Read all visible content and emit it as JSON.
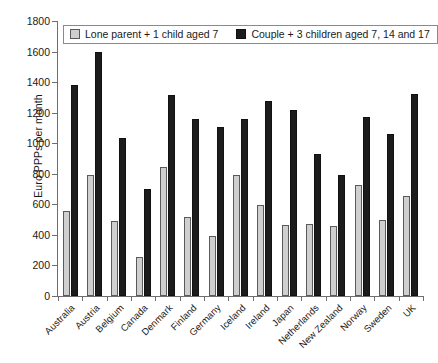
{
  "chart_data": {
    "type": "bar",
    "title": "",
    "xlabel": "",
    "ylabel": "Euro PPPs per month",
    "ylim": [
      0,
      1800
    ],
    "ytick_step": 200,
    "yticks": [
      0,
      200,
      400,
      600,
      800,
      1000,
      1200,
      1400,
      1600,
      1800
    ],
    "grid": false,
    "legend_position": "top-left-inside",
    "categories": [
      "Australia",
      "Austria",
      "Belgium",
      "Canada",
      "Denmark",
      "Finland",
      "Germany",
      "Iceland",
      "Ireland",
      "Japan",
      "Netherlands",
      "New Zealand",
      "Norway",
      "Sweden",
      "UK"
    ],
    "series": [
      {
        "name": "Lone parent + 1 child aged 7",
        "color": "#cfcfcf",
        "values": [
          555,
          790,
          490,
          255,
          845,
          515,
          395,
          790,
          595,
          465,
          470,
          460,
          725,
          495,
          655
        ]
      },
      {
        "name": "Couple + 3 children aged 7, 14 and 17",
        "color": "#1c1c1c",
        "values": [
          1380,
          1600,
          1035,
          700,
          1315,
          1160,
          1105,
          1160,
          1275,
          1220,
          930,
          795,
          1170,
          1060,
          1320
        ]
      }
    ]
  },
  "legend": {
    "entries": [
      {
        "label": "Lone parent + 1 child aged 7"
      },
      {
        "label": "Couple + 3 children aged 7, 14 and 17"
      }
    ]
  },
  "axis": {
    "y_title": "Euro PPPs per month"
  }
}
